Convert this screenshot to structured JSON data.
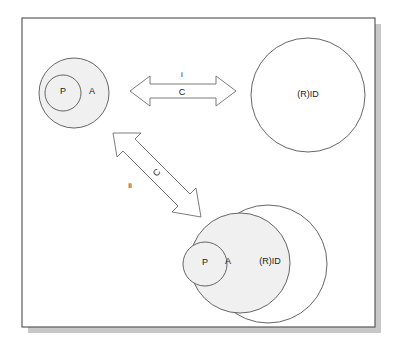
{
  "figure": {
    "frame": {
      "x": 22,
      "y": 18,
      "width": 353,
      "height": 309,
      "shadow_offset": 6,
      "border_color": "#4d4d4d",
      "shadow_color": "#c8c8c8",
      "background": "#ffffff"
    },
    "colors": {
      "filled_set": "#f0f0f0",
      "open_set": "#ffffff",
      "stroke": "#555555",
      "arrow_stroke": "#6e6e6e",
      "arrow_fill": "#ffffff",
      "text": "#1a1a1a"
    }
  },
  "groups": [
    {
      "id": "top-left-group",
      "name": "agent-group-separate",
      "circles": [
        {
          "id": "a-outer",
          "label": "A",
          "cx": 74,
          "cy": 93,
          "r": 35,
          "filled": true,
          "label_x": 92,
          "label_y": 92
        },
        {
          "id": "p-inner",
          "label": "P",
          "cx": 63,
          "cy": 93,
          "r": 18,
          "filled": true,
          "label_x": 63,
          "label_y": 92
        }
      ]
    },
    {
      "id": "top-right-group",
      "name": "rid-group-separate",
      "circles": [
        {
          "id": "rid-alone",
          "label": "(R)ID",
          "cx": 308,
          "cy": 95,
          "r": 57,
          "filled": false,
          "label_x": 308,
          "label_y": 95
        }
      ]
    },
    {
      "id": "bottom-group",
      "name": "nested-group-combined",
      "circles": [
        {
          "id": "rid-outer-b",
          "label": "(R)ID",
          "cx": 268,
          "cy": 264,
          "r": 59,
          "filled": false,
          "label_x": 270,
          "label_y": 262
        },
        {
          "id": "a-outer-b",
          "label": "A",
          "cx": 240,
          "cy": 263,
          "r": 50,
          "filled": true,
          "label_x": 228,
          "label_y": 262
        },
        {
          "id": "p-inner-b",
          "label": "P",
          "cx": 205,
          "cy": 264,
          "r": 22,
          "filled": true,
          "label_x": 205,
          "label_y": 263
        }
      ]
    }
  ],
  "arrows": [
    {
      "id": "arrow-horizontal",
      "name": "relation-arrow-i",
      "orientation": "horizontal",
      "roman_label": "i",
      "relation_label": "C",
      "roman_x": 182,
      "roman_y": 76,
      "relation_x": 182,
      "relation_y": 94,
      "x1": 130,
      "y1": 91,
      "x2": 236,
      "y2": 91,
      "shaft_half": 7,
      "head_half": 15,
      "head_len": 20
    },
    {
      "id": "arrow-diagonal",
      "name": "relation-arrow-ii",
      "orientation": "diagonal",
      "roman_label": "ii",
      "relation_label": "C",
      "roman_x": 130,
      "roman_y": 186,
      "relation_x": 157,
      "relation_y": 173,
      "relation_rotation": -46,
      "x1": 113,
      "y1": 133,
      "x2": 201,
      "y2": 217,
      "shaft_half": 7,
      "head_half": 15,
      "head_len": 20
    }
  ]
}
